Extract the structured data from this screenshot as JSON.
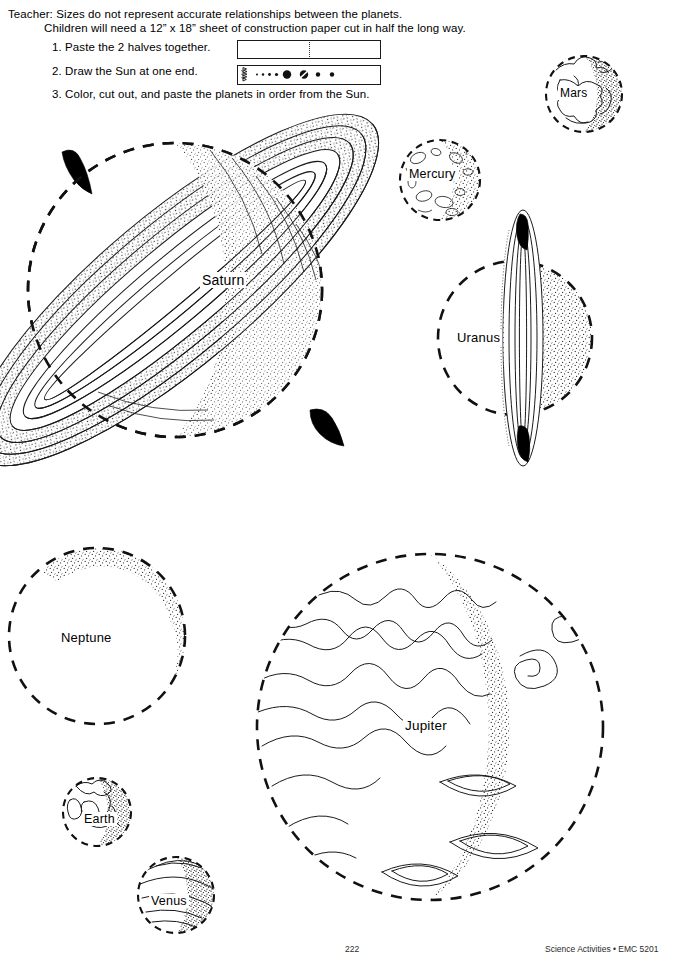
{
  "page": {
    "header": {
      "line1": "Teacher: Sizes do not represent accurate relationships between the planets.",
      "line2": "Children will need a 12” x 18” sheet of construction paper cut in half the long way."
    },
    "steps": [
      {
        "id": "step1",
        "text": "1. Paste the 2 halves together."
      },
      {
        "id": "step2",
        "text": "2. Draw the Sun at one end."
      },
      {
        "id": "step3",
        "text": "3. Color, cut out, and paste the planets in order from the Sun."
      }
    ],
    "diagrams": [
      {
        "id": "diagram-paper-strips",
        "caption_ref": "step1",
        "description": "two paper halves pasted, dotted seam at center"
      },
      {
        "id": "diagram-sun-and-planets",
        "caption_ref": "step2",
        "description": "strip with sun burst at left end followed by planets in order"
      }
    ],
    "footer": {
      "page_number": "222",
      "credit": "Science Activities • EMC 5201"
    }
  },
  "planets": [
    {
      "name": "Mars",
      "label": "Mars",
      "style": "cratered-continents",
      "shade": "right"
    },
    {
      "name": "Mercury",
      "label": "Mercury",
      "style": "cratered",
      "shade": "right"
    },
    {
      "name": "Saturn",
      "label": "Saturn",
      "style": "ringed-diagonal",
      "shade": "right"
    },
    {
      "name": "Uranus",
      "label": "Uranus",
      "style": "ringed-vertical",
      "shade": "right"
    },
    {
      "name": "Neptune",
      "label": "Neptune",
      "style": "plain",
      "shade": "upper-right"
    },
    {
      "name": "Jupiter",
      "label": "Jupiter",
      "style": "banded-storms",
      "shade": "right"
    },
    {
      "name": "Earth",
      "label": "Earth",
      "style": "continents",
      "shade": "right"
    },
    {
      "name": "Venus",
      "label": "Venus",
      "style": "swirled-clouds",
      "shade": "right"
    }
  ],
  "colors": {
    "ink": "#111111",
    "paper": "#ffffff",
    "ring_tip": "#000000"
  }
}
